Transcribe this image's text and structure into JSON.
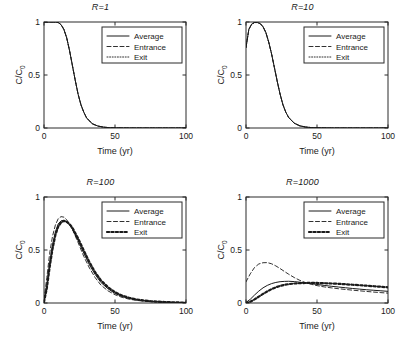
{
  "figure": {
    "panel_count": 4,
    "shared_xlabel": "Time (yr)",
    "shared_ylabel": "C/C",
    "ylabel_sub": "0",
    "legend_entries": [
      "Average",
      "Entrance",
      "Exit"
    ]
  },
  "chart_data": [
    {
      "type": "line",
      "title": "R=1",
      "xlabel": "Time (yr)",
      "ylabel": "C/C0",
      "xlim": [
        0,
        100
      ],
      "ylim": [
        0,
        1
      ],
      "xticks": [
        0,
        50,
        100
      ],
      "xticklabels": [
        "0",
        "50",
        "100"
      ],
      "yticks": [
        0,
        0.5,
        1
      ],
      "yticklabels": [
        "0",
        "0.5",
        "1"
      ],
      "grid": false,
      "legend_position": "upper-right-inset",
      "x": [
        0,
        2,
        4,
        6,
        8,
        10,
        12,
        14,
        16,
        18,
        20,
        22,
        24,
        26,
        28,
        30,
        34,
        38,
        42,
        46,
        50,
        60,
        70,
        80,
        90,
        100
      ],
      "series": [
        {
          "name": "Average",
          "style": "solid",
          "values": [
            1.0,
            1.0,
            1.0,
            1.0,
            1.0,
            0.995,
            0.975,
            0.93,
            0.85,
            0.73,
            0.59,
            0.45,
            0.32,
            0.22,
            0.15,
            0.095,
            0.04,
            0.018,
            0.008,
            0.003,
            0.001,
            0.0,
            0.0,
            0.0,
            0.0,
            0.0
          ]
        },
        {
          "name": "Entrance",
          "style": "dashed",
          "values": [
            1.0,
            1.0,
            1.0,
            1.0,
            1.0,
            0.995,
            0.975,
            0.93,
            0.85,
            0.73,
            0.59,
            0.45,
            0.32,
            0.22,
            0.15,
            0.095,
            0.04,
            0.018,
            0.008,
            0.003,
            0.001,
            0.0,
            0.0,
            0.0,
            0.0,
            0.0
          ]
        },
        {
          "name": "Exit",
          "style": "dotted",
          "values": [
            1.0,
            1.0,
            1.0,
            1.0,
            1.0,
            0.995,
            0.975,
            0.93,
            0.85,
            0.73,
            0.59,
            0.45,
            0.32,
            0.22,
            0.15,
            0.095,
            0.04,
            0.018,
            0.008,
            0.003,
            0.001,
            0.0,
            0.0,
            0.0,
            0.0,
            0.0
          ]
        }
      ]
    },
    {
      "type": "line",
      "title": "R=10",
      "xlabel": "Time (yr)",
      "ylabel": "C/C0",
      "xlim": [
        0,
        100
      ],
      "ylim": [
        0,
        1
      ],
      "xticks": [
        0,
        50,
        100
      ],
      "xticklabels": [
        "0",
        "50",
        "100"
      ],
      "yticks": [
        0,
        0.5,
        1
      ],
      "yticklabels": [
        "0",
        "0.5",
        "1"
      ],
      "grid": false,
      "legend_position": "upper-right-inset",
      "x": [
        0,
        2,
        4,
        6,
        8,
        10,
        12,
        14,
        16,
        18,
        20,
        22,
        24,
        26,
        28,
        30,
        34,
        38,
        42,
        46,
        50,
        60,
        70,
        80,
        90,
        100
      ],
      "series": [
        {
          "name": "Average",
          "style": "solid",
          "values": [
            0.76,
            0.93,
            0.98,
            0.995,
            0.995,
            0.985,
            0.955,
            0.9,
            0.81,
            0.7,
            0.57,
            0.44,
            0.32,
            0.22,
            0.15,
            0.1,
            0.045,
            0.02,
            0.009,
            0.004,
            0.002,
            0.0,
            0.0,
            0.0,
            0.0,
            0.0
          ]
        },
        {
          "name": "Entrance",
          "style": "dashed",
          "values": [
            0.76,
            0.93,
            0.98,
            0.995,
            0.995,
            0.985,
            0.955,
            0.9,
            0.81,
            0.7,
            0.57,
            0.44,
            0.32,
            0.22,
            0.15,
            0.1,
            0.045,
            0.02,
            0.009,
            0.004,
            0.002,
            0.0,
            0.0,
            0.0,
            0.0,
            0.0
          ]
        },
        {
          "name": "Exit",
          "style": "dotted",
          "values": [
            0.76,
            0.93,
            0.98,
            0.995,
            0.995,
            0.985,
            0.955,
            0.9,
            0.81,
            0.7,
            0.57,
            0.44,
            0.32,
            0.22,
            0.15,
            0.1,
            0.045,
            0.02,
            0.009,
            0.004,
            0.002,
            0.0,
            0.0,
            0.0,
            0.0,
            0.0
          ]
        }
      ]
    },
    {
      "type": "line",
      "title": "R=100",
      "xlabel": "Time (yr)",
      "ylabel": "C/C0",
      "xlim": [
        0,
        100
      ],
      "ylim": [
        0,
        1
      ],
      "xticks": [
        0,
        50,
        100
      ],
      "xticklabels": [
        "0",
        "50",
        "100"
      ],
      "yticks": [
        0,
        0.5,
        1
      ],
      "yticklabels": [
        "0",
        "0.5",
        "1"
      ],
      "grid": false,
      "legend_position": "upper-right-inset",
      "x": [
        0,
        2,
        4,
        6,
        8,
        10,
        12,
        14,
        16,
        18,
        20,
        24,
        28,
        32,
        36,
        40,
        45,
        50,
        55,
        60,
        65,
        70,
        75,
        80,
        85,
        90,
        95,
        100
      ],
      "series": [
        {
          "name": "Average",
          "style": "solid",
          "values": [
            0.015,
            0.17,
            0.38,
            0.55,
            0.67,
            0.745,
            0.775,
            0.78,
            0.765,
            0.735,
            0.695,
            0.59,
            0.47,
            0.36,
            0.27,
            0.195,
            0.135,
            0.09,
            0.062,
            0.043,
            0.03,
            0.021,
            0.015,
            0.011,
            0.008,
            0.006,
            0.004,
            0.003
          ]
        },
        {
          "name": "Entrance",
          "style": "dashed",
          "values": [
            0.035,
            0.24,
            0.47,
            0.63,
            0.735,
            0.795,
            0.815,
            0.81,
            0.785,
            0.745,
            0.695,
            0.57,
            0.44,
            0.33,
            0.24,
            0.17,
            0.115,
            0.078,
            0.053,
            0.036,
            0.025,
            0.018,
            0.013,
            0.009,
            0.007,
            0.005,
            0.004,
            0.003
          ]
        },
        {
          "name": "Exit",
          "style": "thick-dotted",
          "values": [
            0.01,
            0.14,
            0.34,
            0.51,
            0.64,
            0.72,
            0.76,
            0.775,
            0.765,
            0.745,
            0.71,
            0.61,
            0.495,
            0.385,
            0.29,
            0.215,
            0.15,
            0.102,
            0.07,
            0.049,
            0.034,
            0.024,
            0.017,
            0.013,
            0.009,
            0.007,
            0.005,
            0.004
          ]
        }
      ]
    },
    {
      "type": "line",
      "title": "R=1000",
      "xlabel": "Time (yr)",
      "ylabel": "C/C0",
      "xlim": [
        0,
        100
      ],
      "ylim": [
        0,
        1
      ],
      "xticks": [
        0,
        50,
        100
      ],
      "xticklabels": [
        "0",
        "50",
        "100"
      ],
      "yticks": [
        0,
        0.5,
        1
      ],
      "yticklabels": [
        "0",
        "0.5",
        "1"
      ],
      "grid": false,
      "legend_position": "upper-right-inset",
      "x": [
        0,
        3,
        6,
        9,
        12,
        15,
        18,
        21,
        24,
        27,
        30,
        34,
        38,
        42,
        46,
        50,
        55,
        60,
        65,
        70,
        75,
        80,
        85,
        90,
        95,
        100
      ],
      "series": [
        {
          "name": "Average",
          "style": "solid",
          "values": [
            0.005,
            0.035,
            0.075,
            0.112,
            0.143,
            0.166,
            0.183,
            0.194,
            0.201,
            0.204,
            0.205,
            0.202,
            0.196,
            0.189,
            0.182,
            0.175,
            0.166,
            0.158,
            0.151,
            0.144,
            0.137,
            0.131,
            0.125,
            0.12,
            0.115,
            0.11
          ]
        },
        {
          "name": "Entrance",
          "style": "dashed",
          "values": [
            0.2,
            0.275,
            0.335,
            0.368,
            0.38,
            0.381,
            0.37,
            0.35,
            0.325,
            0.298,
            0.272,
            0.24,
            0.213,
            0.192,
            0.176,
            0.164,
            0.152,
            0.143,
            0.135,
            0.128,
            0.121,
            0.115,
            0.109,
            0.103,
            0.098,
            0.093
          ]
        },
        {
          "name": "Exit",
          "style": "thick-dotted",
          "values": [
            0.0,
            0.012,
            0.034,
            0.06,
            0.086,
            0.11,
            0.131,
            0.148,
            0.161,
            0.171,
            0.178,
            0.184,
            0.187,
            0.189,
            0.189,
            0.189,
            0.187,
            0.184,
            0.181,
            0.177,
            0.172,
            0.168,
            0.163,
            0.158,
            0.153,
            0.148
          ]
        }
      ]
    }
  ]
}
